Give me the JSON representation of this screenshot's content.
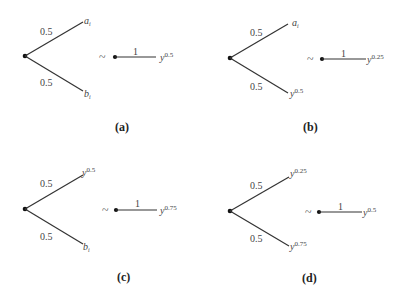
{
  "panels": [
    {
      "id": "a",
      "caption": "(a)",
      "lottery": {
        "upper_prob": "0.5",
        "lower_prob": "0.5",
        "upper_outcome": {
          "base": "a",
          "sub": "i",
          "sup": ""
        },
        "lower_outcome": {
          "base": "b",
          "sub": "i",
          "sup": ""
        }
      },
      "relation": "~",
      "certain": {
        "prob": "1",
        "outcome": {
          "base": "y",
          "sup": "0.5"
        }
      }
    },
    {
      "id": "b",
      "caption": "(b)",
      "lottery": {
        "upper_prob": "0.5",
        "lower_prob": "0.5",
        "upper_outcome": {
          "base": "a",
          "sub": "i",
          "sup": ""
        },
        "lower_outcome": {
          "base": "y",
          "sub": "",
          "sup": "0.5"
        }
      },
      "relation": "~",
      "certain": {
        "prob": "1",
        "outcome": {
          "base": "y",
          "sup": "0.25"
        }
      }
    },
    {
      "id": "c",
      "caption": "(c)",
      "lottery": {
        "upper_prob": "0.5",
        "lower_prob": "0.5",
        "upper_outcome": {
          "base": "y",
          "sub": "",
          "sup": "0.5"
        },
        "lower_outcome": {
          "base": "b",
          "sub": "i",
          "sup": ""
        }
      },
      "relation": "~",
      "certain": {
        "prob": "1",
        "outcome": {
          "base": "y",
          "sup": "0.75"
        }
      }
    },
    {
      "id": "d",
      "caption": "(d)",
      "lottery": {
        "upper_prob": "0.5",
        "lower_prob": "0.5",
        "upper_outcome": {
          "base": "y",
          "sub": "",
          "sup": "0.25"
        },
        "lower_outcome": {
          "base": "y",
          "sub": "",
          "sup": "0.75"
        }
      },
      "relation": "~",
      "certain": {
        "prob": "1",
        "outcome": {
          "base": "y",
          "sup": "0.5"
        }
      }
    }
  ]
}
